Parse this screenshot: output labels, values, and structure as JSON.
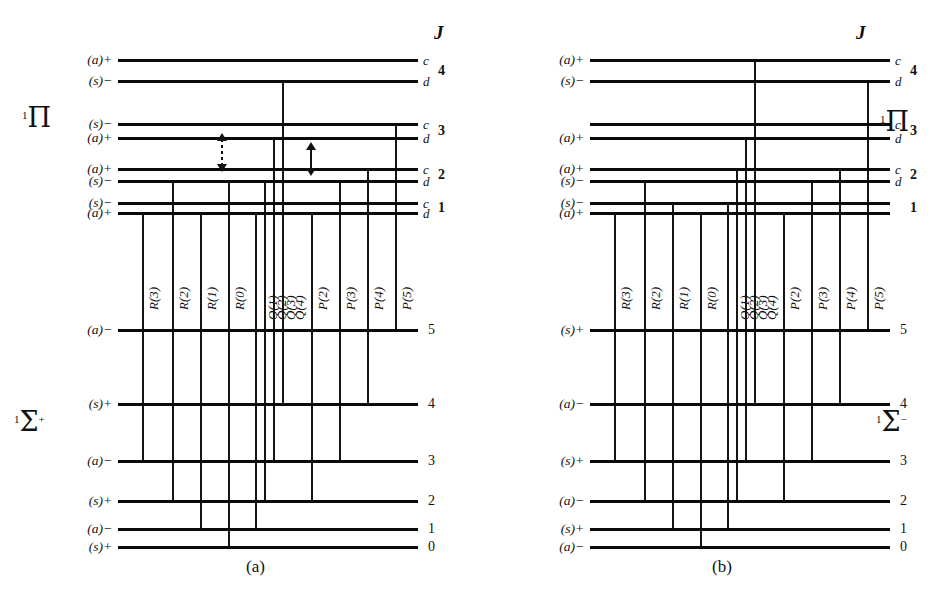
{
  "figure": {
    "j_header": "J",
    "panel_a_caption": "(a)",
    "panel_b_caption": "(b)"
  },
  "panel_a": {
    "caption": "(a)",
    "j_header": "J",
    "upper_term": "¹Π",
    "lower_term": "¹Σ⁺",
    "upper_levels": [
      {
        "J": "4",
        "parity_label": "(a)+",
        "cd": "c",
        "y": 59
      },
      {
        "J": "4",
        "parity_label": "(s)−",
        "cd": "d",
        "y": 80
      },
      {
        "J": "3",
        "parity_label": "(s)−",
        "cd": "c",
        "y": 123
      },
      {
        "J": "3",
        "parity_label": "(a)+",
        "cd": "d",
        "y": 137
      },
      {
        "J": "2",
        "parity_label": "(a)+",
        "cd": "c",
        "y": 168
      },
      {
        "J": "2",
        "parity_label": "(s)−",
        "cd": "d",
        "y": 180
      },
      {
        "J": "1",
        "parity_label": "(s)−",
        "cd": "c",
        "y": 202
      },
      {
        "J": "1",
        "parity_label": "(a)+",
        "cd": "d",
        "y": 212
      }
    ],
    "lower_levels": [
      {
        "J": "5",
        "parity_label": "(a)−",
        "y": 329
      },
      {
        "J": "4",
        "parity_label": "(s)+",
        "y": 403
      },
      {
        "J": "3",
        "parity_label": "(a)−",
        "y": 460
      },
      {
        "J": "2",
        "parity_label": "(s)+",
        "y": 500
      },
      {
        "J": "1",
        "parity_label": "(a)−",
        "y": 528
      },
      {
        "J": "0",
        "parity_label": "(s)+",
        "y": 546
      }
    ],
    "branches": [
      {
        "label": "R(3)",
        "x": 142,
        "upper_y": 212,
        "lower_y": 460
      },
      {
        "label": "R(2)",
        "x": 172,
        "upper_y": 180,
        "lower_y": 500
      },
      {
        "label": "R(1)",
        "x": 200,
        "upper_y": 212,
        "lower_y": 528
      },
      {
        "label": "R(0)",
        "x": 228,
        "upper_y": 180,
        "lower_y": 546
      },
      {
        "label": "Q(1)",
        "x": 255,
        "upper_y": 212,
        "lower_y": 528
      },
      {
        "label": "Q(2)",
        "x": 264,
        "upper_y": 180,
        "lower_y": 500
      },
      {
        "label": "Q(3)",
        "x": 273,
        "upper_y": 137,
        "lower_y": 460
      },
      {
        "label": "Q(4)",
        "x": 282,
        "upper_y": 80,
        "lower_y": 403
      },
      {
        "label": "P(2)",
        "x": 311,
        "upper_y": 212,
        "lower_y": 500
      },
      {
        "label": "P(3)",
        "x": 339,
        "upper_y": 180,
        "lower_y": 460
      },
      {
        "label": "P(4)",
        "x": 367,
        "upper_y": 168,
        "lower_y": 403
      },
      {
        "label": "P(5)",
        "x": 395,
        "upper_y": 123,
        "lower_y": 329
      }
    ],
    "arrows": [
      {
        "name": "forbidden-transition-arrow",
        "style": "dashed",
        "x": 222,
        "y_top": 133,
        "y_bottom": 172
      },
      {
        "name": "allowed-transition-arrow",
        "style": "solid",
        "x": 311,
        "y_top": 142,
        "y_bottom": 176
      }
    ]
  },
  "panel_b": {
    "caption": "(b)",
    "j_header": "J",
    "upper_term": "¹Π",
    "lower_term": "¹Σ⁻",
    "upper_levels": [
      {
        "J": "4",
        "parity_label": "(a)+",
        "cd": "c",
        "y": 59
      },
      {
        "J": "4",
        "parity_label": "(s)−",
        "cd": "d",
        "y": 80
      },
      {
        "J": "3",
        "parity_label": "",
        "cd": "c",
        "y": 123
      },
      {
        "J": "3",
        "parity_label": "(a)+",
        "cd": "d",
        "y": 137
      },
      {
        "J": "2",
        "parity_label": "(a)+",
        "cd": "c",
        "y": 168
      },
      {
        "J": "2",
        "parity_label": "(s)−",
        "cd": "d",
        "y": 180
      },
      {
        "J": "1",
        "parity_label": "(s)−",
        "cd": "",
        "y": 202
      },
      {
        "J": "1",
        "parity_label": "(a)+",
        "cd": "",
        "y": 212
      }
    ],
    "lower_levels": [
      {
        "J": "5",
        "parity_label": "(s)+",
        "y": 329
      },
      {
        "J": "4",
        "parity_label": "(a)−",
        "y": 403
      },
      {
        "J": "3",
        "parity_label": "(s)+",
        "y": 460
      },
      {
        "J": "2",
        "parity_label": "(a)−",
        "y": 500
      },
      {
        "J": "1",
        "parity_label": "(s)+",
        "y": 528
      },
      {
        "J": "0",
        "parity_label": "(a)−",
        "y": 546
      }
    ],
    "branches": [
      {
        "label": "R(3)",
        "x": 142,
        "upper_y": 212,
        "lower_y": 460
      },
      {
        "label": "R(2)",
        "x": 172,
        "upper_y": 180,
        "lower_y": 500
      },
      {
        "label": "R(1)",
        "x": 200,
        "upper_y": 202,
        "lower_y": 528
      },
      {
        "label": "R(0)",
        "x": 228,
        "upper_y": 212,
        "lower_y": 546
      },
      {
        "label": "Q(1)",
        "x": 255,
        "upper_y": 202,
        "lower_y": 528
      },
      {
        "label": "Q(2)",
        "x": 264,
        "upper_y": 168,
        "lower_y": 500
      },
      {
        "label": "Q(3)",
        "x": 273,
        "upper_y": 137,
        "lower_y": 460
      },
      {
        "label": "Q(4)",
        "x": 282,
        "upper_y": 59,
        "lower_y": 403
      },
      {
        "label": "P(2)",
        "x": 311,
        "upper_y": 212,
        "lower_y": 500
      },
      {
        "label": "P(3)",
        "x": 339,
        "upper_y": 180,
        "lower_y": 460
      },
      {
        "label": "P(4)",
        "x": 367,
        "upper_y": 168,
        "lower_y": 403
      },
      {
        "label": "P(5)",
        "x": 395,
        "upper_y": 80,
        "lower_y": 329
      }
    ],
    "arrows": []
  },
  "chart_data": {
    "type": "diagram",
    "panels": [
      "(a)",
      "(b)"
    ],
    "branch_labels": [
      "R(3)",
      "R(2)",
      "R(1)",
      "R(0)",
      "Q(1)",
      "Q(2)",
      "Q(3)",
      "Q(4)",
      "P(2)",
      "P(3)",
      "P(4)",
      "P(5)"
    ],
    "upper_J_values": [
      "4",
      "3",
      "2",
      "1"
    ],
    "lower_J_values": [
      "5",
      "4",
      "3",
      "2",
      "1",
      "0"
    ],
    "lambda_doubling_labels": [
      "c",
      "d"
    ],
    "panel_a_terms": {
      "upper": "1Π",
      "lower": "1Σ+"
    },
    "panel_b_terms": {
      "upper": "1Π",
      "lower": "1Σ-"
    },
    "panel_a_upper_parities": [
      "(a)+",
      "(s)−",
      "(s)−",
      "(a)+",
      "(a)+",
      "(s)−",
      "(s)−",
      "(a)+"
    ],
    "panel_a_lower_parities": [
      "(a)−",
      "(s)+",
      "(a)−",
      "(s)+",
      "(a)−",
      "(s)+"
    ],
    "panel_b_upper_parities": [
      "(a)+",
      "(s)−",
      "",
      "(a)+",
      "(a)+",
      "(s)−",
      "(s)−",
      "(a)+"
    ],
    "panel_b_lower_parities": [
      "(s)+",
      "(a)−",
      "(s)+",
      "(a)−",
      "(s)+",
      "(a)−"
    ]
  }
}
